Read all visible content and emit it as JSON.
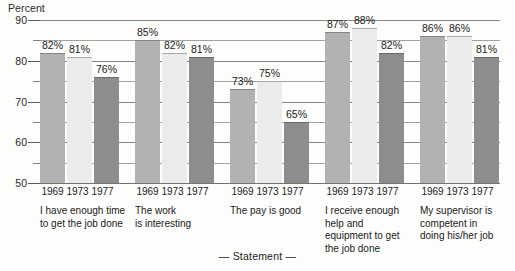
{
  "chart_data": {
    "type": "bar",
    "title": "",
    "ylabel": "Percent",
    "xlabel": "— Statement —",
    "ylim": [
      50,
      90
    ],
    "y_major_ticks": [
      50,
      60,
      70,
      80,
      90
    ],
    "y_minor_ticks": [
      55,
      65,
      75,
      85
    ],
    "grid": true,
    "legend": "none",
    "value_suffix": "%",
    "categories": [
      "I have enough time to get the job done",
      "The work is interesting",
      "The pay is good",
      "I receive enough help and equipment to get the job done",
      "My supervisor is competent in doing his/her job"
    ],
    "series": [
      {
        "name": "1969",
        "color": "#b2b2b2",
        "values": [
          82,
          85,
          73,
          87,
          86
        ]
      },
      {
        "name": "1973",
        "color": "#ebebeb",
        "values": [
          81,
          82,
          75,
          88,
          86
        ]
      },
      {
        "name": "1977",
        "color": "#8d8d8d",
        "values": [
          76,
          81,
          65,
          82,
          81
        ]
      }
    ]
  },
  "axis": {
    "y_title": "Percent",
    "x_title": "— Statement —",
    "y_labels": [
      "90",
      "80",
      "70",
      "60",
      "50"
    ]
  },
  "groups": [
    {
      "years": [
        "1969",
        "1973",
        "1977"
      ],
      "values": [
        "82%",
        "81%",
        "76%"
      ],
      "statement_lines": [
        "I have enough time",
        "to get the job done"
      ]
    },
    {
      "years": [
        "1969",
        "1973",
        "1977"
      ],
      "values": [
        "85%",
        "82%",
        "81%"
      ],
      "statement_lines": [
        "The work",
        "is interesting"
      ]
    },
    {
      "years": [
        "1969",
        "1973",
        "1977"
      ],
      "values": [
        "73%",
        "75%",
        "65%"
      ],
      "statement_lines": [
        "The pay is good"
      ]
    },
    {
      "years": [
        "1969",
        "1973",
        "1977"
      ],
      "values": [
        "87%",
        "88%",
        "82%"
      ],
      "statement_lines": [
        "I receive enough",
        "help and",
        "equipment to get",
        "the job done"
      ]
    },
    {
      "years": [
        "1969",
        "1973",
        "1977"
      ],
      "values": [
        "86%",
        "86%",
        "81%"
      ],
      "statement_lines": [
        "My supervisor is",
        "competent in",
        "doing his/her job"
      ]
    }
  ]
}
